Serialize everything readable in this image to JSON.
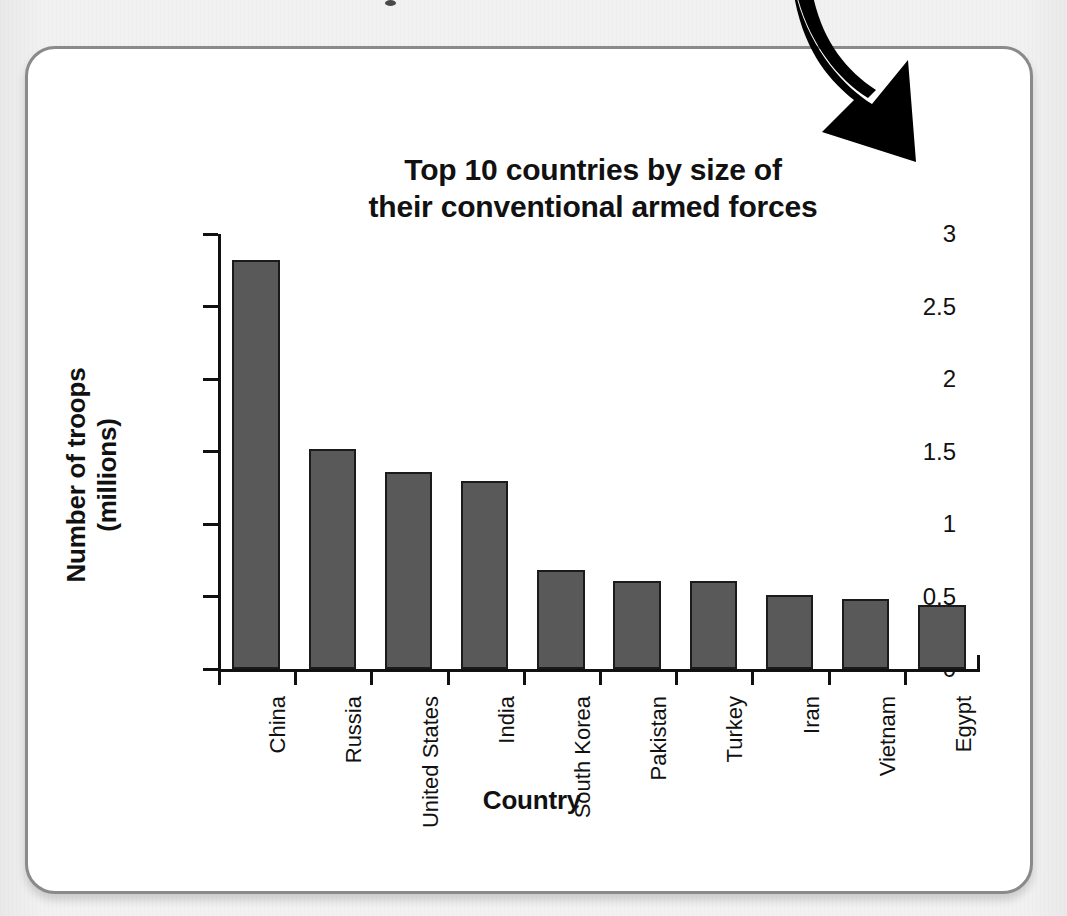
{
  "card": {
    "border_color": "#8a8a8a",
    "background": "#ffffff"
  },
  "annotation": {
    "arrow_name": "curved-down-right-arrow",
    "arrow_color": "#000000"
  },
  "chart_data": {
    "type": "bar",
    "title": "Top 10 countries by size of their conventional armed forces",
    "title_lines": [
      "Top 10 countries by size of",
      "their conventional armed forces"
    ],
    "xlabel": "Country",
    "ylabel": "Number of troops (millions)",
    "categories": [
      "China",
      "Russia",
      "United States",
      "India",
      "South Korea",
      "Pakistan",
      "Turkey",
      "Iran",
      "Vietnam",
      "Egypt"
    ],
    "values": [
      2.82,
      1.52,
      1.36,
      1.3,
      0.68,
      0.61,
      0.61,
      0.51,
      0.48,
      0.44
    ],
    "ylim": [
      0,
      3
    ],
    "ytick_values": [
      0,
      0.5,
      1,
      1.5,
      2,
      2.5,
      3
    ],
    "ytick_labels": [
      "0",
      "0.5",
      "1",
      "1.5",
      "2",
      "2.5",
      "3"
    ],
    "grid": false,
    "legend": false,
    "bar_color": "#595959",
    "bar_edge_color": "#1b1b1b",
    "axis_color": "#111111"
  }
}
